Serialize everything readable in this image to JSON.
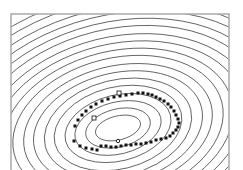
{
  "figure": {
    "name": "contour-scatter-figure",
    "background_color": "#ffffff",
    "width": 243,
    "height": 170
  },
  "frame": {
    "name": "plot-frame",
    "x": 11,
    "y": 14,
    "width": 218,
    "height": 164,
    "stroke": "#8a8a8a",
    "stroke_width": 1.1,
    "fill": "none",
    "note": "bottom edge extends past the visible image area"
  },
  "chart_data": {
    "type": "scatter",
    "title": "",
    "subtitle": "",
    "xlabel": "",
    "ylabel": "",
    "xlim": [
      0,
      243
    ],
    "ylim": [
      0,
      170
    ],
    "grid": false,
    "legend": "none",
    "axis_ticks": "none",
    "axis_tick_labels": [],
    "annotations": [],
    "contours": {
      "type": "contour",
      "style": "concentric-ellipses",
      "stroke": "#1a1a1a",
      "stroke_width": 0.62,
      "fill": "none",
      "count": 18,
      "center_x": 118,
      "center_y": 128,
      "rotation_deg": -14,
      "innermost_rx": 23,
      "innermost_ry": 12,
      "radius_step_x": 10.5,
      "radius_step_y": 7.2,
      "levels": [
        {
          "index": 1,
          "rx": 23,
          "ry": 12
        },
        {
          "index": 2,
          "rx": 33,
          "ry": 19
        },
        {
          "index": 3,
          "rx": 44,
          "ry": 26
        },
        {
          "index": 4,
          "rx": 54,
          "ry": 33
        },
        {
          "index": 5,
          "rx": 65,
          "ry": 41
        },
        {
          "index": 6,
          "rx": 75,
          "ry": 48
        },
        {
          "index": 7,
          "rx": 86,
          "ry": 55
        },
        {
          "index": 8,
          "rx": 96,
          "ry": 62
        },
        {
          "index": 9,
          "rx": 107,
          "ry": 70
        },
        {
          "index": 10,
          "rx": 117,
          "ry": 77
        },
        {
          "index": 11,
          "rx": 128,
          "ry": 84
        },
        {
          "index": 12,
          "rx": 138,
          "ry": 91
        },
        {
          "index": 13,
          "rx": 149,
          "ry": 99
        },
        {
          "index": 14,
          "rx": 159,
          "ry": 106
        },
        {
          "index": 15,
          "rx": 170,
          "ry": 113
        },
        {
          "index": 16,
          "rx": 180,
          "ry": 120
        },
        {
          "index": 17,
          "rx": 191,
          "ry": 128
        },
        {
          "index": 18,
          "rx": 201,
          "ry": 135
        }
      ]
    },
    "series": [
      {
        "name": "data-points",
        "marker": "filled-square",
        "marker_color": "#111111",
        "marker_size": 3.0,
        "point_count": 48,
        "pattern": "elliptical-ring",
        "points": [
          {
            "x": 74,
            "y": 141
          },
          {
            "x": 80,
            "y": 146
          },
          {
            "x": 86,
            "y": 148
          },
          {
            "x": 92,
            "y": 149
          },
          {
            "x": 97,
            "y": 150
          },
          {
            "x": 101,
            "y": 146
          },
          {
            "x": 106,
            "y": 146
          },
          {
            "x": 111,
            "y": 147
          },
          {
            "x": 116,
            "y": 147
          },
          {
            "x": 121,
            "y": 146
          },
          {
            "x": 126,
            "y": 145
          },
          {
            "x": 131,
            "y": 145
          },
          {
            "x": 136,
            "y": 144
          },
          {
            "x": 141,
            "y": 144
          },
          {
            "x": 146,
            "y": 143
          },
          {
            "x": 151,
            "y": 142
          },
          {
            "x": 156,
            "y": 140
          },
          {
            "x": 161,
            "y": 139
          },
          {
            "x": 166,
            "y": 138
          },
          {
            "x": 170,
            "y": 136
          },
          {
            "x": 173,
            "y": 133
          },
          {
            "x": 176,
            "y": 130
          },
          {
            "x": 178,
            "y": 127
          },
          {
            "x": 179,
            "y": 123
          },
          {
            "x": 178,
            "y": 119
          },
          {
            "x": 176,
            "y": 115
          },
          {
            "x": 174,
            "y": 111
          },
          {
            "x": 171,
            "y": 107
          },
          {
            "x": 168,
            "y": 104
          },
          {
            "x": 164,
            "y": 101
          },
          {
            "x": 160,
            "y": 99
          },
          {
            "x": 156,
            "y": 97
          },
          {
            "x": 152,
            "y": 95
          },
          {
            "x": 148,
            "y": 94
          },
          {
            "x": 143,
            "y": 93
          },
          {
            "x": 138,
            "y": 93
          },
          {
            "x": 132,
            "y": 94
          },
          {
            "x": 126,
            "y": 95
          },
          {
            "x": 120,
            "y": 96
          },
          {
            "x": 114,
            "y": 97
          },
          {
            "x": 108,
            "y": 99
          },
          {
            "x": 102,
            "y": 101
          },
          {
            "x": 96,
            "y": 104
          },
          {
            "x": 91,
            "y": 107
          },
          {
            "x": 86,
            "y": 111
          },
          {
            "x": 82,
            "y": 115
          },
          {
            "x": 78,
            "y": 120
          },
          {
            "x": 75,
            "y": 126
          }
        ]
      },
      {
        "name": "center-marker",
        "marker": "open-circle",
        "marker_color": "#111111",
        "marker_size": 3.4,
        "points": [
          {
            "x": 118,
            "y": 141
          }
        ]
      },
      {
        "name": "open-square-markers",
        "marker": "open-square",
        "marker_color": "#111111",
        "marker_size": 4.0,
        "points": [
          {
            "x": 94,
            "y": 118
          },
          {
            "x": 119,
            "y": 93
          }
        ]
      }
    ]
  }
}
